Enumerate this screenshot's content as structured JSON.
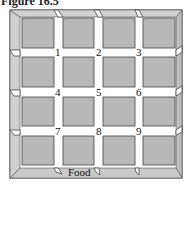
{
  "figure": {
    "title": "Figure 16.5",
    "colors": {
      "frame": "#c4c4c4",
      "box": "#b8b8b8",
      "corridor": "#ffffff",
      "outline": "#333333"
    }
  },
  "maze": {
    "rows": 4,
    "cols": 4,
    "intersections": [
      {
        "label": "1"
      },
      {
        "label": "2"
      },
      {
        "label": "3"
      },
      {
        "label": "4"
      },
      {
        "label": "5"
      },
      {
        "label": "6"
      },
      {
        "label": "7"
      },
      {
        "label": "8"
      },
      {
        "label": "9"
      }
    ],
    "goal_label": "Food"
  }
}
